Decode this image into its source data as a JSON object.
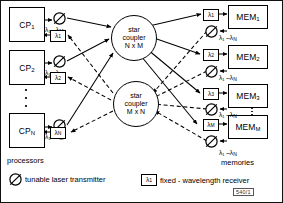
{
  "figure": {
    "id_box": "540/1",
    "processors_caption": "processors",
    "memories_caption": "memories"
  },
  "couplers": [
    {
      "line1": "star",
      "line2": "coupler",
      "line3": "N x M"
    },
    {
      "line1": "star",
      "line2": "coupler",
      "line3": "M x N"
    }
  ],
  "processors": [
    {
      "name": "CP",
      "index": "1",
      "tx_range": "λ₁ –λ",
      "tx_range_sub": "M",
      "rx": "λ",
      "rx_sub": "1"
    },
    {
      "name": "CP",
      "index": "2",
      "tx_range": "λ₁ –λ",
      "tx_range_sub": "M",
      "rx": "λ",
      "rx_sub": "2"
    },
    {
      "name": "CP",
      "index": "N",
      "tx_range": "λ₁ –λ",
      "tx_range_sub": "M",
      "rx": "λ",
      "rx_sub": "N"
    }
  ],
  "memories": [
    {
      "name": "MEM",
      "index": "1",
      "rx": "λ",
      "rx_sub": "1",
      "tx_range": "λ₁ –λ",
      "tx_range_sub": "N"
    },
    {
      "name": "MEM",
      "index": "2",
      "rx": "λ",
      "rx_sub": "2",
      "tx_range": "λ₁ –λ",
      "tx_range_sub": "N"
    },
    {
      "name": "MEM",
      "index": "3",
      "rx": "λ",
      "rx_sub": "3",
      "tx_range": "λ₁ –λ",
      "tx_range_sub": "N"
    },
    {
      "name": "MEM",
      "index": "M",
      "rx": "λ",
      "rx_sub": "M",
      "tx_range": "λ₁ –λ",
      "tx_range_sub": "N"
    }
  ],
  "legend": {
    "transmitter_label": "tunable laser transmitter",
    "receiver_label": "fixed - wavelength  receiver",
    "receiver_symbol": "λ",
    "receiver_symbol_sub": "1"
  }
}
